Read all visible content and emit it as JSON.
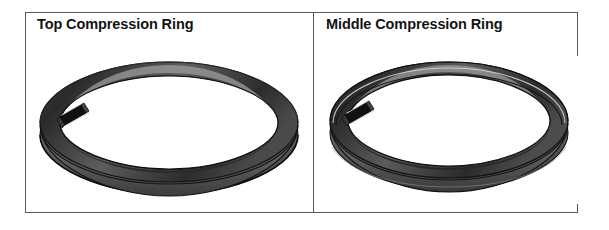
{
  "figure": {
    "type": "two-panel technical illustration",
    "background_color": "#ffffff",
    "frame_color": "#5a5a5a",
    "panels": [
      {
        "id": "top-compression-ring",
        "title": "Top Compression Ring",
        "illustration": {
          "name": "piston-ring-3d",
          "description": "perspective view of a split piston compression ring with a butt gap at upper-left, rectangular cross-section",
          "face_color": "#6e6e6e",
          "outline_color": "#1c1c1c",
          "shadow_color": "#3a3a3a",
          "highlight_color": "#9b9b9b",
          "gap_position": "upper-left",
          "profile": "rectangular"
        }
      },
      {
        "id": "middle-compression-ring",
        "title": "Middle Compression Ring",
        "illustration": {
          "name": "piston-ring-3d",
          "description": "perspective view of a split piston compression ring with a butt gap at upper-left and a tapered / grooved outer face",
          "face_color": "#6e6e6e",
          "outline_color": "#1c1c1c",
          "shadow_color": "#3a3a3a",
          "highlight_color": "#9b9b9b",
          "gap_position": "upper-left",
          "profile": "tapered-with-groove"
        }
      }
    ]
  }
}
